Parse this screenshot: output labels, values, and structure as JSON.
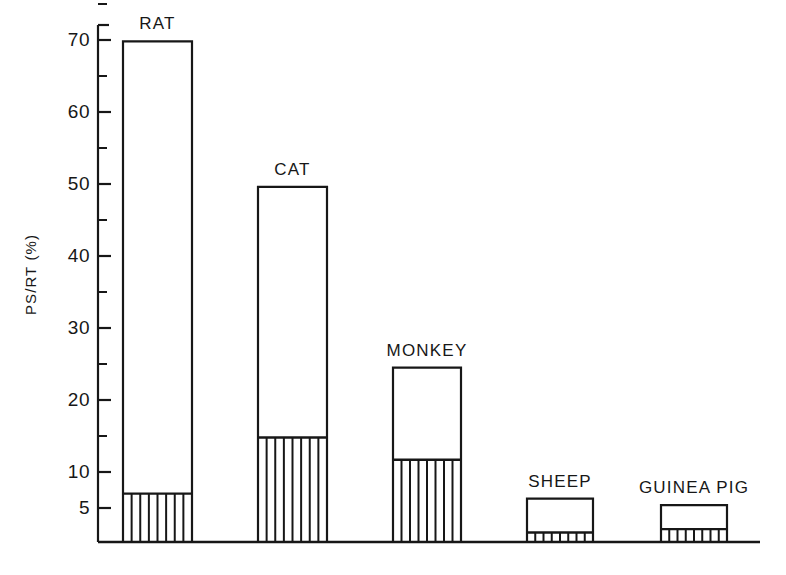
{
  "figure": {
    "background": "#ffffff",
    "ink_color": "#171717"
  },
  "axes": {
    "y_title": "PS/RT (%)",
    "y_major_labels": [
      "70",
      "60",
      "50",
      "40",
      "30",
      "20",
      "10",
      "5"
    ],
    "y_minor_ticks": [
      "75",
      "65",
      "55",
      "45",
      "35",
      "25",
      "15"
    ],
    "x_title": ""
  },
  "bars": [
    {
      "label": "RAT",
      "total": 69.8,
      "hatched": 7.0,
      "hatch_lines": 7
    },
    {
      "label": "CAT",
      "total": 49.6,
      "hatched": 14.8,
      "hatch_lines": 7
    },
    {
      "label": "MONKEY",
      "total": 24.5,
      "hatched": 11.7,
      "hatch_lines": 7
    },
    {
      "label": "SHEEP",
      "total": 6.3,
      "hatched": 1.4,
      "hatch_lines": 7
    },
    {
      "label": "GUINEA PIG",
      "total": 5.4,
      "hatched": 1.9,
      "hatch_lines": 7
    }
  ],
  "chart_data": {
    "type": "bar",
    "title": "",
    "xlabel": "",
    "ylabel": "PS/RT (%)",
    "ylim": [
      0,
      75
    ],
    "grid": false,
    "legend": null,
    "y_scale_note": "non-linear: region below 5% is vertically compressed",
    "y_ticks_major": [
      5,
      10,
      20,
      30,
      40,
      50,
      60,
      70
    ],
    "y_ticks_minor": [
      15,
      25,
      35,
      45,
      55,
      65,
      75
    ],
    "categories": [
      "RAT",
      "CAT",
      "MONKEY",
      "SHEEP",
      "GUINEA PIG"
    ],
    "series": [
      {
        "name": "hatched (lower segment)",
        "values": [
          7.0,
          14.8,
          11.7,
          1.4,
          1.9
        ]
      },
      {
        "name": "open (total bar height)",
        "values": [
          69.8,
          49.6,
          24.5,
          6.3,
          5.4
        ]
      }
    ],
    "values": [
      69.8,
      49.6,
      24.5,
      6.3,
      5.4
    ],
    "annotations": [
      "RAT",
      "CAT",
      "MONKEY",
      "SHEEP",
      "GUINEA PIG"
    ]
  }
}
